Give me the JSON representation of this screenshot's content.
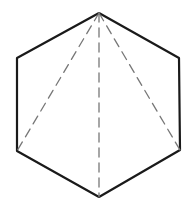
{
  "figure": {
    "shape": "regular hexagon",
    "background": "#ffffff",
    "outline_color": "#1a1a1a",
    "outline_width": 2.2,
    "dashed_color": "#777777",
    "dashed_width": 1.3,
    "dash_pattern": "9 6",
    "vertices": {
      "top": [
        99,
        13
      ],
      "upper_right": [
        179,
        58
      ],
      "lower_right": [
        180,
        150
      ],
      "bottom": [
        99,
        197
      ],
      "lower_left": [
        17,
        151
      ],
      "upper_left": [
        17,
        58
      ]
    },
    "diagonals_from": "top",
    "diagonals_to": [
      "lower_left",
      "bottom",
      "lower_right"
    ]
  }
}
